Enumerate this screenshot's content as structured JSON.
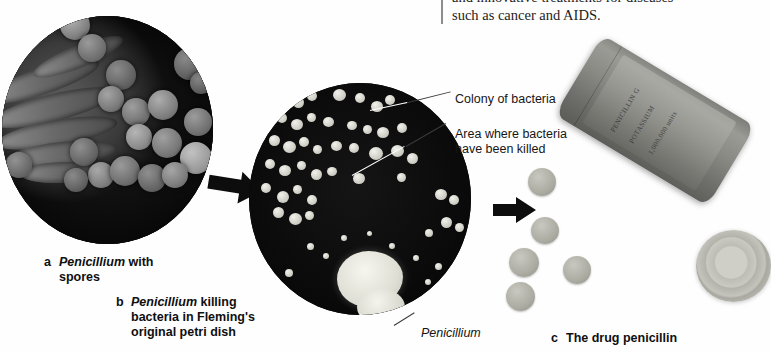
{
  "figure": {
    "body_text": {
      "line1": "and innovative treatments for diseases",
      "line2": "such as cancer and AIDS."
    },
    "callouts": [
      {
        "id": "colony",
        "text": "Colony of bacteria"
      },
      {
        "id": "killed",
        "text": "Area where bacteria\nhave been killed"
      },
      {
        "id": "pencil",
        "text": "Penicillium"
      }
    ],
    "captions": [
      {
        "letter": "a",
        "italic": "Penicillium",
        "rest": " with",
        "line2": "spores"
      },
      {
        "letter": "b",
        "italic": "Penicillium",
        "rest": " killing",
        "line2": "bacteria in Fleming's",
        "line3": "original petri dish"
      },
      {
        "letter": "c",
        "italic": "",
        "rest": "The drug penicillin",
        "line2": ""
      }
    ],
    "panels": [
      {
        "id": "a",
        "kind": "sem-micrograph",
        "subject": "Penicillium hyphae and spores"
      },
      {
        "id": "b",
        "kind": "petri-dish-photo",
        "subject": "bacterial colonies and Penicillium"
      },
      {
        "id": "c",
        "kind": "product-photo",
        "subject": "penicillin bottle, tablets and lid"
      }
    ],
    "arrows": [
      {
        "id": "arrow-a-to-b",
        "direction": "right"
      },
      {
        "id": "arrow-b-to-c",
        "direction": "right"
      }
    ],
    "bottle_label_text": {
      "l1": "PENICILLIN G",
      "l2": "POTASSIUM",
      "l3": "1,000,000 units"
    },
    "colors": {
      "page_bg": "#ffffff",
      "text": "#161616",
      "dark_field": "#050505",
      "colony": "#e8e8e0",
      "arrow": "#0d0d0d",
      "rule": "#8d8d8d"
    }
  }
}
